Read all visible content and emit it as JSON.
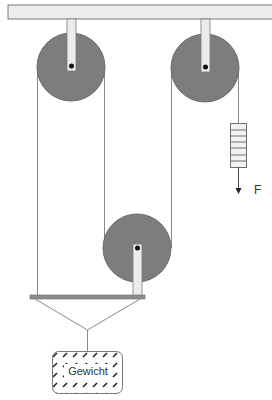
{
  "diagram": {
    "type": "pulley-system",
    "labels": {
      "force": "F",
      "weight": "Gewicht"
    },
    "colors": {
      "pulley_fill": "#7d7d7d",
      "ceiling_fill": "#ececec",
      "hanger_fill": "#ececec",
      "outline": "#6f6f6f",
      "rope": "#8a8a8a",
      "bar_fill": "#8c8c8c",
      "axle": "#111111",
      "hatch": "#222222"
    },
    "components": [
      {
        "id": "ceiling",
        "kind": "fixed-support"
      },
      {
        "id": "pulley-top-left",
        "kind": "fixed-pulley"
      },
      {
        "id": "pulley-top-right",
        "kind": "fixed-pulley"
      },
      {
        "id": "pulley-bottom",
        "kind": "movable-pulley"
      },
      {
        "id": "spring-scale",
        "kind": "force-meter"
      },
      {
        "id": "crossbar",
        "kind": "load-bar"
      },
      {
        "id": "weight",
        "kind": "load"
      }
    ]
  }
}
